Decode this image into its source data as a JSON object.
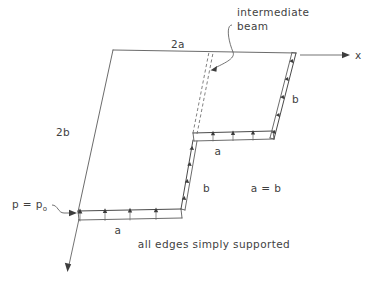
{
  "figure": {
    "title_alt": "Simply supported plate with intermediate beam",
    "background_color": "#ffffff",
    "line_color": "#5a5a5a",
    "text_color": "#3f3f3f",
    "width": 377,
    "height": 290,
    "labels": {
      "top_edge": "2a",
      "left_edge": "2b",
      "intermediate_beam_line1": "intermediate",
      "intermediate_beam_line2": "beam",
      "axis_x": "x",
      "pressure_prefix": "p = p",
      "pressure_subscript": "o",
      "strip_bottom": "a",
      "strip_middle": "a",
      "edge_lower_right": "b",
      "edge_upper_right": "b",
      "relation": "a = b",
      "boundary_condition": "all edges simply supported"
    },
    "geometry": {
      "plate_top_left": [
        113,
        50
      ],
      "plate_top_right": [
        296,
        53
      ],
      "plate_bottom_left": [
        78,
        212
      ],
      "plate_mid_notch": [
        192,
        140
      ],
      "strip_bottom_span": [
        78,
        180
      ],
      "strip_middle_span": [
        192,
        272
      ],
      "strip_bottom_y": 212,
      "strip_middle_y": 140,
      "strip_thickness": 8,
      "load_arrow_count_bottom": 3,
      "load_arrow_count_middle": 3
    }
  }
}
